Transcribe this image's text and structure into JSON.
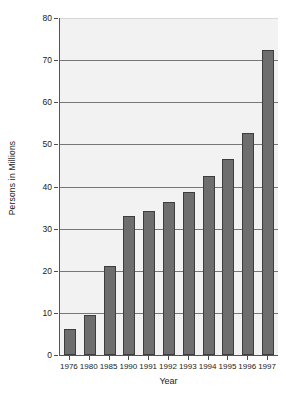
{
  "chart_data": {
    "type": "bar",
    "title": "",
    "xlabel": "Year",
    "ylabel": "Persons in Millions",
    "categories": [
      "1976",
      "1980",
      "1985",
      "1990",
      "1991",
      "1992",
      "1993",
      "1994",
      "1995",
      "1996",
      "1997"
    ],
    "values": [
      6.2,
      9.4,
      21.2,
      33.1,
      34.1,
      36.3,
      38.7,
      42.5,
      46.5,
      52.8,
      72.4
    ],
    "ylim": [
      0,
      80
    ],
    "yticks": [
      0,
      10,
      20,
      30,
      40,
      50,
      60,
      70,
      80
    ],
    "ytick_labels": [
      "0",
      "10",
      "20",
      "30",
      "40",
      "50",
      "60",
      "70",
      "80"
    ],
    "grid": true,
    "grid_axis": "y",
    "legend": false,
    "legend_position": "none",
    "series": [
      {
        "name": "Persons in Millions",
        "values": [
          6.2,
          9.4,
          21.2,
          33.1,
          34.1,
          36.3,
          38.7,
          42.5,
          46.5,
          52.8,
          72.4
        ]
      }
    ]
  },
  "style": {
    "bar_color": "#6e6e6e",
    "bar_border_color": "#3d3d3d",
    "plot_background": "#f2f2f2",
    "gridline_color": "#777777",
    "axis_color": "#555555",
    "text_color": "#1a1a1a",
    "figure_background": "#ffffff"
  }
}
